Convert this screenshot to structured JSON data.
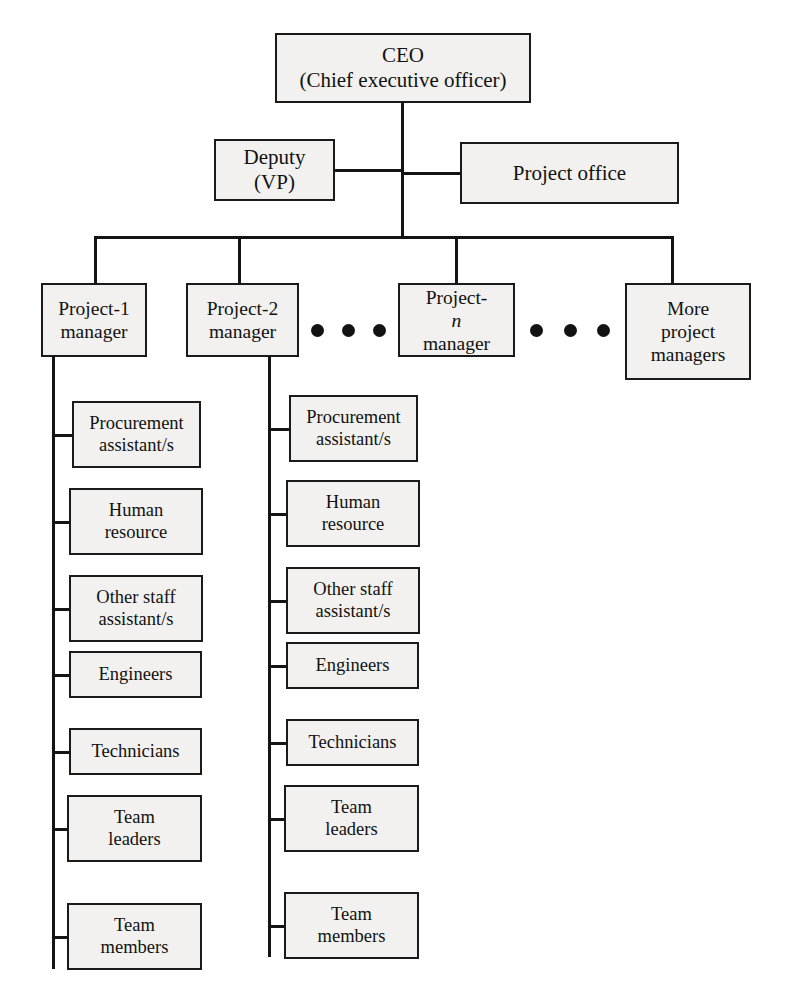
{
  "diagram": {
    "box_fill": "#f2f1ef",
    "line_color": "#141414",
    "ceo": {
      "line1": "CEO",
      "line2": "(Chief executive officer)"
    },
    "deputy": {
      "line1": "Deputy",
      "line2": "(VP)"
    },
    "project_office": {
      "line1": "Project office"
    },
    "managers": [
      {
        "line1": "Project-1",
        "line2": "manager"
      },
      {
        "line1": "Project-2",
        "line2": "manager"
      },
      {
        "line1": "Project-",
        "italic": "n",
        "line2": "manager"
      },
      {
        "line1": "More",
        "line2": "project",
        "line3": "managers"
      }
    ],
    "ellipsis_label": "ellipsis-dots",
    "staff_column_1": [
      {
        "line1": "Procurement",
        "line2": "assistant/s"
      },
      {
        "line1": "Human",
        "line2": "resource"
      },
      {
        "line1": "Other staff",
        "line2": "assistant/s"
      },
      {
        "line1": "Engineers"
      },
      {
        "line1": "Technicians"
      },
      {
        "line1": "Team",
        "line2": "leaders"
      },
      {
        "line1": "Team",
        "line2": "members"
      }
    ],
    "staff_column_2": [
      {
        "line1": "Procurement",
        "line2": "assistant/s"
      },
      {
        "line1": "Human",
        "line2": "resource"
      },
      {
        "line1": "Other staff",
        "line2": "assistant/s"
      },
      {
        "line1": "Engineers"
      },
      {
        "line1": "Technicians"
      },
      {
        "line1": "Team",
        "line2": "leaders"
      },
      {
        "line1": "Team",
        "line2": "members"
      }
    ]
  }
}
